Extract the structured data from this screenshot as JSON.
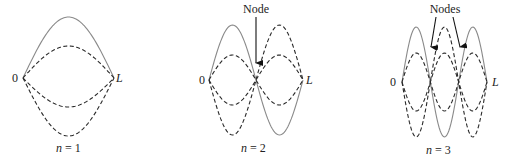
{
  "figure": {
    "panels": [
      {
        "id": "n1",
        "mode": 1,
        "caption": "n = 1",
        "caption_var": "n",
        "caption_value": "= 1",
        "left_label": "0",
        "right_label": "L",
        "x0": 23,
        "x1": 114,
        "y_center": 78,
        "solid_amplitude": 61,
        "dashed_amplitudes": [
          32,
          -29,
          -58
        ],
        "node_label": null,
        "node_positions": []
      },
      {
        "id": "n2",
        "mode": 2,
        "caption": "n = 2",
        "caption_var": "n",
        "caption_value": "= 2",
        "left_label": "0",
        "right_label": "L",
        "x0": 209,
        "x1": 303,
        "y_center": 80,
        "solid_amplitude": 55,
        "dashed_amplitudes": [
          25,
          -25,
          -55
        ],
        "node_label": "Node",
        "node_positions": [
          256
        ]
      },
      {
        "id": "n3",
        "mode": 3,
        "caption": "n = 3",
        "caption_var": "n",
        "caption_value": "= 3",
        "left_label": "0",
        "right_label": "L",
        "x0": 402,
        "x1": 487,
        "y_center": 82,
        "solid_amplitude": 55,
        "dashed_amplitudes": [
          29,
          -29,
          -55
        ],
        "node_label": "Nodes",
        "node_positions": [
          430,
          459
        ]
      }
    ],
    "colors": {
      "solid_curve": "#8a8a8a",
      "dashed_curve": "#2a2a2a",
      "text": "#222222",
      "background": "#ffffff"
    }
  }
}
